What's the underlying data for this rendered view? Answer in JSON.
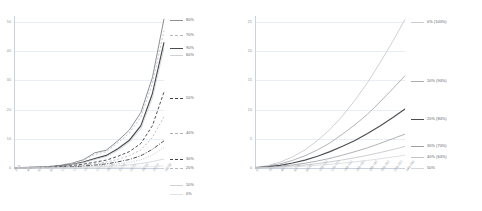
{
  "figure": {
    "panel_count": 2,
    "background": "#ffffff"
  },
  "chart_data": [
    {
      "type": "line",
      "title": "",
      "xlabel": "",
      "ylabel": "",
      "grid": true,
      "legend_position": "right",
      "ylim": [
        0,
        52
      ],
      "yticks": [
        0,
        10,
        20,
        30,
        40,
        50
      ],
      "ytick_labels": [
        "0",
        "10",
        "20",
        "30",
        "40",
        "50"
      ],
      "x": [
        "2/13",
        "4/8",
        "5/7",
        "8/6",
        "11/13",
        "12/12",
        "19/05",
        "17/10",
        "25/16",
        "22/23",
        "22/22",
        "26/20",
        "27/27",
        "28/28"
      ],
      "xtick_labels": [
        "2/13",
        "4/8",
        "5/7",
        "8/6",
        "11/13",
        "12/12",
        "19/05",
        "17/10",
        "25/16",
        "22/23",
        "22/22",
        "26/20",
        "27/27",
        "28/28"
      ],
      "series": [
        {
          "name": "80%",
          "color": "#8c8f94",
          "dash": "none",
          "width": 1.0,
          "values": [
            0.1,
            0.2,
            0.3,
            0.5,
            0.9,
            1.6,
            2.8,
            5.2,
            6.1,
            9.3,
            13.0,
            19.0,
            31.0,
            51.0
          ]
        },
        {
          "name": "70%",
          "color": "#b6b9bd",
          "dash": "2 2",
          "width": 0.8,
          "values": [
            0.1,
            0.2,
            0.3,
            0.5,
            0.9,
            1.5,
            2.6,
            4.6,
            5.6,
            8.6,
            12.0,
            17.5,
            29.0,
            47.0
          ]
        },
        {
          "name": "90%",
          "color": "#4a4d52",
          "dash": "none",
          "width": 1.2,
          "values": [
            0.05,
            0.1,
            0.2,
            0.35,
            0.7,
            1.2,
            2.0,
            3.2,
            4.3,
            6.6,
            9.5,
            14.5,
            25.5,
            43.0
          ]
        },
        {
          "name": "60%",
          "color": "#cfd2d6",
          "dash": "none",
          "width": 0.8,
          "values": [
            0.05,
            0.1,
            0.2,
            0.3,
            0.6,
            1.1,
            1.8,
            2.9,
            3.9,
            6.0,
            8.8,
            13.5,
            24.0,
            41.0
          ]
        },
        {
          "name": "50%",
          "color": "#3f4246",
          "dash": "3 2",
          "width": 0.9,
          "values": [
            0.05,
            0.08,
            0.15,
            0.25,
            0.45,
            0.8,
            1.3,
            2.0,
            2.7,
            4.0,
            5.6,
            8.4,
            14.5,
            26.0
          ]
        },
        {
          "name": "40%",
          "color": "#aeb1b6",
          "dash": "2 2",
          "width": 0.8,
          "values": [
            0.03,
            0.06,
            0.1,
            0.18,
            0.33,
            0.58,
            0.95,
            1.5,
            2.0,
            3.0,
            4.2,
            6.2,
            10.5,
            17.5
          ]
        },
        {
          "name": "30%",
          "color": "#3f4246",
          "dash": "4 1.5 1 1.5",
          "width": 0.9,
          "values": [
            0.02,
            0.04,
            0.07,
            0.12,
            0.22,
            0.4,
            0.65,
            1.0,
            1.4,
            2.1,
            2.9,
            4.2,
            6.4,
            9.3
          ]
        },
        {
          "name": "20%",
          "color": "#b6b9bd",
          "dash": "1 1.5",
          "width": 0.8,
          "values": [
            0.02,
            0.03,
            0.05,
            0.09,
            0.16,
            0.28,
            0.45,
            0.7,
            0.95,
            1.4,
            1.95,
            2.8,
            4.4,
            7.0
          ]
        },
        {
          "name": "10%",
          "color": "#cfd2d6",
          "dash": "none",
          "width": 0.8,
          "values": [
            0.01,
            0.02,
            0.03,
            0.05,
            0.09,
            0.15,
            0.25,
            0.38,
            0.52,
            0.75,
            1.05,
            1.5,
            2.2,
            3.1
          ]
        },
        {
          "name": "0%",
          "color": "#dfe2e5",
          "dash": "none",
          "width": 0.8,
          "values": [
            0.0,
            0.0,
            0.01,
            0.01,
            0.02,
            0.04,
            0.06,
            0.09,
            0.12,
            0.18,
            0.25,
            0.35,
            0.5,
            0.7
          ]
        }
      ]
    },
    {
      "type": "line",
      "title": "",
      "xlabel": "",
      "ylabel": "",
      "grid": true,
      "legend_position": "right",
      "ylim": [
        0,
        26
      ],
      "yticks": [
        0,
        5,
        10,
        15,
        20,
        25
      ],
      "ytick_labels": [
        "0",
        "5",
        "10",
        "15",
        "20",
        "25"
      ],
      "x": [
        "0-1",
        "20-21",
        "40-41",
        "60-61",
        "80-81",
        "100-101",
        "120-121",
        "140-141",
        "160-161",
        "180-181",
        "200-201",
        "220-221",
        "240-241"
      ],
      "xtick_labels": [
        "0-1",
        "20-21",
        "40-41",
        "60-61",
        "80-81",
        "100-101",
        "120-121",
        "140-141",
        "160-161",
        "180-181",
        "200-201",
        "220-221",
        "240-241"
      ],
      "series": [
        {
          "name": "0% (100%)",
          "color": "#c9ccd1",
          "dash": "none",
          "width": 0.9,
          "values": [
            0.1,
            0.4,
            1.0,
            1.9,
            3.1,
            4.7,
            6.6,
            8.9,
            11.6,
            14.6,
            18.0,
            21.6,
            25.4
          ]
        },
        {
          "name": "10% (90%)",
          "color": "#a9acb1",
          "dash": "none",
          "width": 0.9,
          "values": [
            0.08,
            0.3,
            0.7,
            1.3,
            2.1,
            3.1,
            4.3,
            5.8,
            7.4,
            9.2,
            11.3,
            13.5,
            15.8
          ]
        },
        {
          "name": "20% (80%)",
          "color": "#4a4d52",
          "dash": "none",
          "width": 1.1,
          "values": [
            0.05,
            0.2,
            0.45,
            0.85,
            1.35,
            2.0,
            2.8,
            3.7,
            4.7,
            5.9,
            7.2,
            8.6,
            10.1
          ]
        },
        {
          "name": "30% (70%)",
          "color": "#9da0a5",
          "dash": "none",
          "width": 0.8,
          "values": [
            0.03,
            0.12,
            0.28,
            0.52,
            0.82,
            1.2,
            1.65,
            2.2,
            2.8,
            3.45,
            4.2,
            5.0,
            5.8
          ]
        },
        {
          "name": "40% (60%)",
          "color": "#bfc2c6",
          "dash": "none",
          "width": 0.8,
          "values": [
            0.02,
            0.08,
            0.18,
            0.33,
            0.52,
            0.76,
            1.05,
            1.38,
            1.76,
            2.18,
            2.64,
            3.14,
            3.7
          ]
        },
        {
          "name": "50%",
          "color": "#d5d8db",
          "dash": "none",
          "width": 0.8,
          "values": [
            0.01,
            0.05,
            0.11,
            0.2,
            0.32,
            0.46,
            0.63,
            0.83,
            1.05,
            1.3,
            1.58,
            1.88,
            2.2
          ]
        }
      ]
    }
  ]
}
